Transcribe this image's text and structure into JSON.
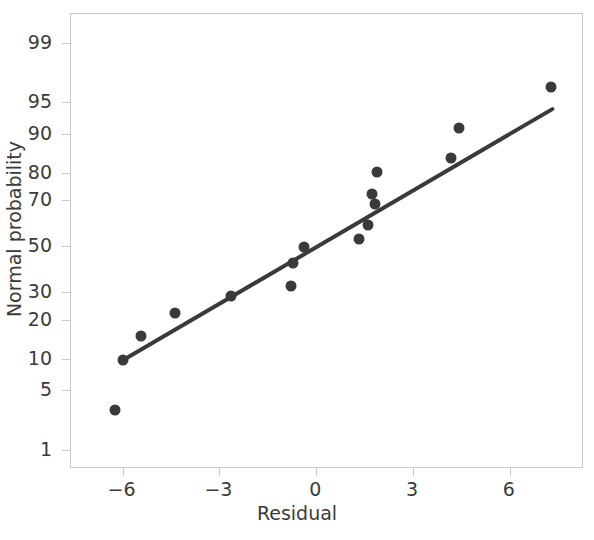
{
  "chart_data": {
    "type": "scatter",
    "title": "",
    "xlabel": "Residual",
    "ylabel": "Normal probability",
    "xlim": [
      -7.6,
      8.3
    ],
    "ylim": [
      0.55,
      99.6
    ],
    "grid": false,
    "legend": null,
    "y_scale": "normal-probability",
    "y_ticks": [
      1,
      5,
      10,
      20,
      30,
      50,
      70,
      80,
      90,
      95,
      99
    ],
    "y_tick_labels": [
      "1",
      "5",
      "10",
      "20",
      "30",
      "50",
      "70",
      "80",
      "90",
      "95",
      "99"
    ],
    "x_ticks": [
      -6,
      -3,
      0,
      3,
      6
    ],
    "x_tick_labels": [
      "−6",
      "−3",
      "0",
      "3",
      "6"
    ],
    "series": [
      {
        "name": "residual-points",
        "marker": "circle",
        "color": "#3a3a3a",
        "points": [
          {
            "x": -6.2,
            "y": 3.0
          },
          {
            "x": -5.95,
            "y": 9.5
          },
          {
            "x": -5.4,
            "y": 15.0
          },
          {
            "x": -4.35,
            "y": 22.0
          },
          {
            "x": -2.6,
            "y": 28.0
          },
          {
            "x": -0.75,
            "y": 32.0
          },
          {
            "x": -0.7,
            "y": 42.0
          },
          {
            "x": -0.35,
            "y": 49.0
          },
          {
            "x": 1.35,
            "y": 53.0
          },
          {
            "x": 1.65,
            "y": 59.0
          },
          {
            "x": 1.85,
            "y": 68.0
          },
          {
            "x": 1.75,
            "y": 72.0
          },
          {
            "x": 1.9,
            "y": 80.0
          },
          {
            "x": 4.2,
            "y": 84.0
          },
          {
            "x": 4.45,
            "y": 91.0
          },
          {
            "x": 7.3,
            "y": 96.5
          }
        ]
      },
      {
        "name": "reference-line",
        "type": "line",
        "color": "#3a3a3a",
        "x_start": -5.95,
        "y_start": 9.5,
        "x_end": 7.35,
        "y_end": 94.0
      }
    ],
    "frame_color": "#c9c9c9",
    "text_color": "#3b3b3b"
  }
}
